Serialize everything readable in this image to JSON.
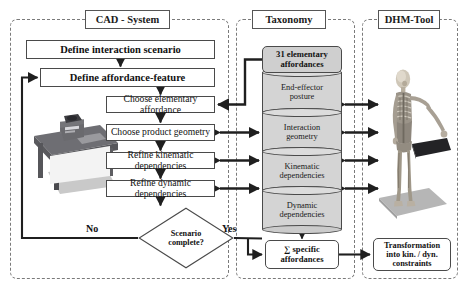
{
  "groups": [
    {
      "id": "cad",
      "label": "CAD - System"
    },
    {
      "id": "taxonomy",
      "label": "Taxonomy"
    },
    {
      "id": "dhm",
      "label": "DHM-Tool"
    }
  ],
  "cad": {
    "title": "CAD - System",
    "steps": [
      {
        "id": "define-interaction-scenario",
        "label": "Define interaction scenario",
        "bold": true
      },
      {
        "id": "define-affordance-feature",
        "label": "Define affordance-feature",
        "bold": true
      },
      {
        "id": "choose-elementary-affordance",
        "label": "Choose elementary affordance",
        "bold": false
      },
      {
        "id": "choose-product-geometry",
        "label": "Choose product geometry",
        "bold": false
      },
      {
        "id": "refine-kinematic-dependencies",
        "label": "Refine kinematic dependencies",
        "bold": false
      },
      {
        "id": "refine-dynamic-dependencies",
        "label": "Refine dynamic dependencies",
        "bold": false
      }
    ],
    "decision": {
      "line1": "Scenario",
      "line2": "complete?",
      "no_label": "No",
      "yes_label": "Yes"
    },
    "illustration": "cad-workstation-desk-photo"
  },
  "taxonomy": {
    "title": "Taxonomy",
    "header_box": {
      "line1": "31 elementary",
      "line2": "affordances"
    },
    "database_layers": [
      {
        "line1": "End-effector",
        "line2": "posture"
      },
      {
        "line1": "Interaction",
        "line2": "geometry"
      },
      {
        "line1": "Kinematic",
        "line2": "dependencies"
      },
      {
        "line1": "Dynamic",
        "line2": "dependencies"
      }
    ],
    "result_box": {
      "line1": "∑ specific",
      "line2": "affordances"
    }
  },
  "dhm": {
    "title": "DHM-Tool",
    "illustration": "human-anatomical-skeleton-model",
    "result_box": {
      "line1": "Transformation",
      "line2": "into kin. / dyn.",
      "line3": "constraints"
    }
  },
  "colors": {
    "line": "#4a4a4a",
    "dashed_border": "#7a7a7a",
    "cylinder_fill": "#d4d4d4",
    "header_box_fill": "#cfcfcf",
    "background": "#ffffff",
    "text": "#111111"
  }
}
